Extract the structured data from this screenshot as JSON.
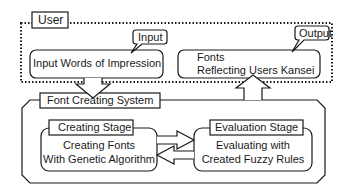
{
  "diagram": {
    "user_group": {
      "label": "User"
    },
    "input_box": {
      "text": "Input Words of Impression",
      "callout": "Input"
    },
    "output_box": {
      "line1": "Fonts",
      "line2": "Reflecting Users Kansei",
      "callout": "Output"
    },
    "system": {
      "label": "Font Creating System"
    },
    "creating_stage": {
      "title": "Creating Stage",
      "line1": "Creating Fonts",
      "line2": "With Genetic Algorithm"
    },
    "evaluation_stage": {
      "title": "Evaluation Stage",
      "line1": "Evaluating with",
      "line2": "Created Fuzzy Rules"
    },
    "colors": {
      "stroke": "#1a1a1a",
      "background": "#ffffff"
    }
  }
}
